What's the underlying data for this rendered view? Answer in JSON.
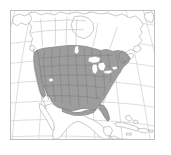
{
  "figure": {
    "kind": "distribution-range-map",
    "region_depicted": "North America",
    "projection": "conic",
    "frame": {
      "border_color": "#bfbfbf",
      "background_color": "#ffffff",
      "x": 10,
      "y": 10,
      "width": 145,
      "height": 130
    },
    "margin_color": "#ffffff"
  },
  "legend_colors": {
    "shaded_range_fill": "#9d9d9d",
    "shaded_range_stroke": "#7a7a7a",
    "unshaded_land_fill": "#ffffff",
    "unshaded_land_stroke": "#b0b0b0",
    "ocean_fill": "#ffffff",
    "graticule_stroke": "#d9d9d9",
    "subdivision_stroke": "#7c7c7c",
    "lake_fill": "#ffffff"
  },
  "map_features": {
    "shaded_areas": [
      "Contiguous United States",
      "Southern Canada"
    ],
    "unshaded_areas": [
      "Northern Canada",
      "Alaska",
      "Mexico",
      "Cuba",
      "Hispaniola",
      "Bahamas",
      "Central America",
      "Greenland edge"
    ],
    "water_bodies": [
      "Great Lakes",
      "Hudson Bay",
      "Gulf of Mexico",
      "Pacific Ocean",
      "Atlantic Ocean",
      "Great Salt Lake"
    ],
    "subdivisions_drawn": true,
    "graticule_drawn": true
  },
  "graticule": {
    "meridian_count": 8,
    "parallel_count": 7
  },
  "labels": {
    "title": "",
    "caption": "",
    "axis_labels": [],
    "tick_labels": [],
    "legend_entries": [],
    "annotations": []
  }
}
